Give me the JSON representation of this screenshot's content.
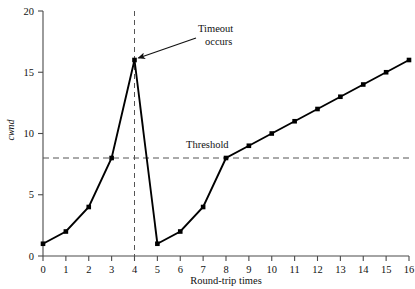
{
  "chart_data": {
    "type": "line",
    "title": "",
    "subtitle": "",
    "xlabel": "Round-trip times",
    "ylabel": "cwnd",
    "xlim": [
      0,
      16
    ],
    "ylim": [
      0,
      20
    ],
    "xticks": [
      0,
      1,
      2,
      3,
      4,
      5,
      6,
      7,
      8,
      9,
      10,
      11,
      12,
      13,
      14,
      15,
      16
    ],
    "yticks": [
      0,
      5,
      10,
      15,
      20
    ],
    "xticklabels": [
      "0",
      "1",
      "2",
      "3",
      "4",
      "5",
      "6",
      "7",
      "8",
      "9",
      "10",
      "11",
      "12",
      "13",
      "14",
      "15",
      "16"
    ],
    "yticklabels": [
      "0",
      "5",
      "10",
      "15",
      "20"
    ],
    "grid": false,
    "legend": false,
    "marker": "square",
    "line_color": "#000000",
    "series": [
      {
        "name": "cwnd",
        "x": [
          0,
          1,
          2,
          3,
          4
        ],
        "values": [
          1,
          2,
          4,
          8,
          16
        ]
      },
      {
        "name": "cwnd-after-timeout",
        "x": [
          5,
          6,
          7,
          8,
          9,
          10,
          11,
          12,
          13,
          14,
          15,
          16
        ],
        "values": [
          1,
          2,
          4,
          8,
          9,
          10,
          11,
          12,
          13,
          14,
          15,
          16
        ]
      }
    ],
    "drop_segment": {
      "from_x": 4,
      "from_y": 16,
      "to_x": 5,
      "to_y": 1
    },
    "threshold": {
      "value": 8,
      "label": "Threshold",
      "style": "dashed"
    },
    "timeout_marker": {
      "x": 4,
      "label": "Timeout occurs",
      "style": "dashed-vertical"
    },
    "annotations": [
      {
        "name": "timeout-annotation",
        "text_line1": "Timeout",
        "text_line2": "occurs",
        "points_to_x": 4,
        "points_to_y": 16
      },
      {
        "name": "threshold-annotation",
        "text": "Threshold"
      }
    ]
  },
  "colors": {
    "line": "#000000",
    "axis": "#444444",
    "dash": "#555555",
    "background": "#ffffff",
    "text": "#111111"
  }
}
